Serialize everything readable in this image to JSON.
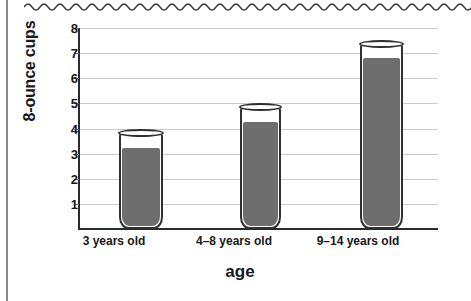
{
  "page": {
    "top_edge_icon": "wavy-torn-page-edge",
    "spine_rule_icon": "vertical-rule"
  },
  "chart_data": {
    "type": "bar",
    "title": "",
    "subtitle": "",
    "xlabel": "age",
    "ylabel": "8-ounce cups",
    "categories": [
      "3 years old",
      "4–8 years old",
      "9–14 years old"
    ],
    "values": [
      3.2,
      4.25,
      6.8
    ],
    "cup_capacities": [
      3.85,
      4.9,
      7.4
    ],
    "series": [
      {
        "name": "8-ounce cups",
        "values": [
          3.2,
          4.25,
          6.8
        ]
      }
    ],
    "ylim": [
      0,
      8
    ],
    "ytick_labels": [
      "8",
      "7",
      "6",
      "5",
      "4",
      "3",
      "2",
      "1"
    ],
    "ytick_values": [
      8,
      7,
      6,
      5,
      4,
      3,
      2,
      1
    ],
    "grid": true,
    "legend": "none",
    "bar_style": "drinking-glass-pictogram",
    "colors": {
      "fill": "#6e6e6e",
      "outline": "#2f3032",
      "gridline": "#c9cacc",
      "axis": "#2a2b2d",
      "text": "#17181a",
      "background": "#ffffff"
    }
  }
}
